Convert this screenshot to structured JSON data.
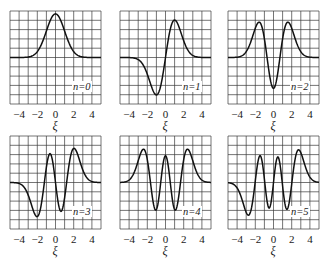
{
  "figure": {
    "xlabel": "ξ",
    "xticks": [
      "−4",
      "−2",
      "0",
      "2",
      "4"
    ],
    "panel_labels": [
      "n=0",
      "n=1",
      "n=2",
      "n=3",
      "n=4",
      "n=5"
    ]
  },
  "chart_data": {
    "type": "line",
    "xlabel": "ξ",
    "ylabel": "",
    "xlim": [
      -5,
      5
    ],
    "ylim": [
      -0.8,
      0.8
    ],
    "grid": true,
    "grid_divisions": [
      10,
      10
    ],
    "xticks": [
      -4,
      -2,
      0,
      2,
      4
    ],
    "layout": "2x3 small multiples",
    "x": [
      -5,
      -4.5,
      -4,
      -3.5,
      -3,
      -2.5,
      -2,
      -1.5,
      -1,
      -0.5,
      0,
      0.5,
      1,
      1.5,
      2,
      2.5,
      3,
      3.5,
      4,
      4.5,
      5
    ],
    "series": [
      {
        "name": "n=0",
        "values": [
          0.0,
          0.0,
          0.0003,
          0.0017,
          0.0084,
          0.0331,
          0.1019,
          0.2449,
          0.4556,
          0.6632,
          0.7511,
          0.6632,
          0.4556,
          0.2449,
          0.1019,
          0.0331,
          0.0084,
          0.0017,
          0.0003,
          0.0,
          0.0
        ]
      },
      {
        "name": "n=1",
        "values": [
          -0.0,
          -0.0002,
          -0.0017,
          -0.0086,
          -0.0356,
          -0.1171,
          -0.2883,
          -0.5196,
          -0.6443,
          -0.469,
          0.0,
          0.469,
          0.6443,
          0.5196,
          0.2883,
          0.1171,
          0.0356,
          0.0086,
          0.0017,
          0.0002,
          0.0
        ]
      },
      {
        "name": "n=2",
        "values": [
          0.0001,
          0.001,
          0.0064,
          0.0265,
          0.0894,
          0.2225,
          0.3603,
          0.3032,
          -0.0,
          -0.3125,
          -0.5311,
          -0.3125,
          -0.0,
          0.3032,
          0.3603,
          0.2225,
          0.0894,
          0.0265,
          0.0064,
          0.001,
          0.0001
        ]
      },
      {
        "name": "n=3",
        "values": [
          -0.0004,
          -0.0034,
          -0.0189,
          -0.0695,
          -0.1928,
          -0.343,
          -0.3328,
          0.0,
          0.372,
          0.3829,
          0.0,
          -0.3829,
          -0.372,
          -0.0,
          0.3328,
          0.343,
          0.1928,
          0.0695,
          0.0189,
          0.0034,
          0.0004
        ]
      },
      {
        "name": "n=4",
        "values": [
          0.0013,
          0.0095,
          0.0449,
          0.1417,
          0.3018,
          0.3785,
          0.1431,
          -0.2553,
          -0.3199,
          0.085,
          0.46,
          0.085,
          -0.3199,
          -0.2553,
          0.1431,
          0.3785,
          0.3018,
          0.1417,
          0.0449,
          0.0095,
          0.0013
        ]
      },
      {
        "name": "n=5",
        "values": [
          -0.004,
          -0.0236,
          -0.0939,
          -0.2329,
          -0.3713,
          -0.2796,
          0.1386,
          0.3604,
          -0.0275,
          -0.3683,
          0.0,
          0.3683,
          0.0275,
          -0.3604,
          -0.1386,
          0.2796,
          0.3713,
          0.2329,
          0.0939,
          0.0236,
          0.004
        ]
      }
    ]
  }
}
